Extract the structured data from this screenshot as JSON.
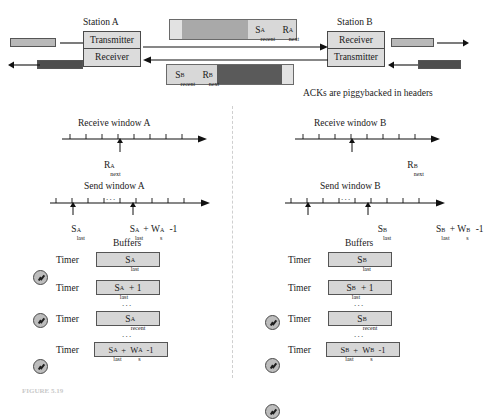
{
  "figure": {
    "caption": "FIGURE 5.19",
    "note": "ACKs are piggybacked in headers"
  },
  "stations": {
    "a": {
      "title": "Station A",
      "cells": [
        "Transmitter",
        "Receiver"
      ]
    },
    "b": {
      "title": "Station B",
      "cells": [
        "Receiver",
        "Transmitter"
      ]
    }
  },
  "packets": {
    "a_to_b": {
      "header_fields": [
        {
          "base": "S",
          "sup": "A",
          "sub": "recent"
        },
        {
          "base": "R",
          "sup": "A",
          "sub": "next"
        }
      ]
    },
    "b_to_a": {
      "header_fields": [
        {
          "base": "S",
          "sup": "B",
          "sub": "recent"
        },
        {
          "base": "R",
          "sup": "B",
          "sub": "next"
        }
      ]
    }
  },
  "windows": {
    "a": {
      "receive_title": "Receive window A",
      "receive_marker": {
        "base": "R",
        "sup": "A",
        "sub": "next"
      },
      "send_title": "Send window A",
      "send_marker_left": {
        "base": "S",
        "sup": "A",
        "sub": "last"
      },
      "send_marker_right": {
        "left": {
          "base": "S",
          "sup": "A",
          "sub": "last"
        },
        "op": " + ",
        "right": {
          "base": "W",
          "sup": "A",
          "sub": "s"
        },
        "tail": "-1"
      },
      "ellipsis": "..."
    },
    "b": {
      "receive_title": "Receive window B",
      "receive_marker": {
        "base": "R",
        "sup": "B",
        "sub": "next"
      },
      "send_title": "Send window B",
      "send_marker_left": {
        "base": "S",
        "sup": "B",
        "sub": "last"
      },
      "send_marker_right": {
        "left": {
          "base": "S",
          "sup": "B",
          "sub": "last"
        },
        "op": " + ",
        "right": {
          "base": "W",
          "sup": "B",
          "sub": "s"
        },
        "tail": "-1"
      },
      "ellipsis": "..."
    }
  },
  "buffers": {
    "a": {
      "title": "Buffers",
      "timer_label": "Timer",
      "ellipsis": "...",
      "rows": [
        {
          "timer": true,
          "parts": [
            {
              "base": "S",
              "sup": "A",
              "sub": "last"
            }
          ],
          "tail": ""
        },
        {
          "timer": true,
          "parts": [
            {
              "base": "S",
              "sup": "A",
              "sub": "last"
            }
          ],
          "tail": " + 1"
        },
        {
          "timer": true,
          "parts": [
            {
              "base": "S",
              "sup": "A",
              "sub": "recent"
            }
          ],
          "tail": ""
        },
        {
          "timer": false,
          "parts": [
            {
              "base": "S",
              "sup": "A",
              "sub": "last"
            },
            {
              "base": "W",
              "sup": "A",
              "sub": "s"
            }
          ],
          "tail": "-1"
        }
      ]
    },
    "b": {
      "title": "Buffers",
      "timer_label": "Timer",
      "ellipsis": "...",
      "rows": [
        {
          "timer": true,
          "parts": [
            {
              "base": "S",
              "sup": "B",
              "sub": "last"
            }
          ],
          "tail": ""
        },
        {
          "timer": true,
          "parts": [
            {
              "base": "S",
              "sup": "B",
              "sub": "last"
            }
          ],
          "tail": " + 1"
        },
        {
          "timer": true,
          "parts": [
            {
              "base": "S",
              "sup": "B",
              "sub": "recent"
            }
          ],
          "tail": ""
        },
        {
          "timer": false,
          "parts": [
            {
              "base": "S",
              "sup": "B",
              "sub": "last"
            },
            {
              "base": "W",
              "sup": "B",
              "sub": "s"
            }
          ],
          "tail": "-1"
        }
      ]
    }
  },
  "colors": {
    "frame_light": "#b9b9b9",
    "frame_dark": "#4e4e4e",
    "packet_body_light": "#a9a9a9",
    "packet_body_dark": "#5a5a5a",
    "packet_header": "#d8d8d8",
    "station_fill": "#dcdcdc",
    "buffer_fill": "#d6d6d6",
    "line": "#111111",
    "divider": "#cfcfcf"
  }
}
